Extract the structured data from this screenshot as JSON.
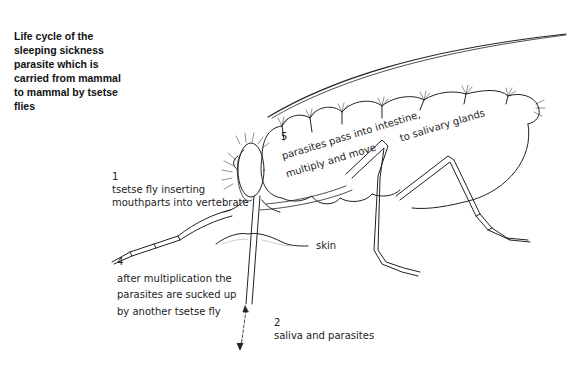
{
  "diagram": {
    "title": "Life cycle of the sleeping sickness parasite which is carried from mammal to mammal by tsetse flies",
    "title_lines": [
      "Life cycle of the",
      "sleeping sickness",
      "parasite which is",
      "carried from mammal",
      "to mammal by tsetse",
      "flies"
    ],
    "steps": [
      {
        "number": "1",
        "lines": [
          "tsetse fly inserting",
          "mouthparts into vertebrate"
        ]
      },
      {
        "number": "2",
        "lines": [
          "saliva and parasites"
        ]
      },
      {
        "number": "4",
        "lines": [
          "after multiplication the",
          "parasites are sucked up",
          "by another tsetse fly"
        ]
      },
      {
        "number": "5",
        "lines": [
          "parasites pass into intestine,",
          "multiply and move",
          "to salivary glands"
        ]
      }
    ],
    "labels": {
      "skin": "skin"
    },
    "line_color": "#222222",
    "background": "#ffffff"
  }
}
